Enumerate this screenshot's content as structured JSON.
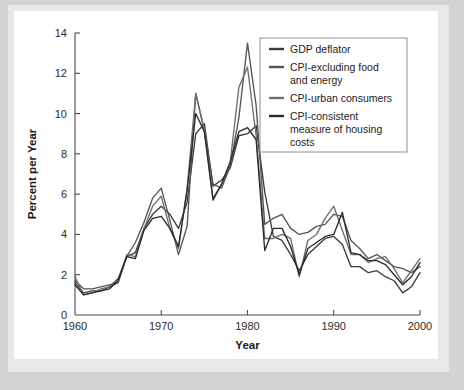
{
  "figure": {
    "background_color": "#d3d3d3",
    "panel_color": "#ffffff",
    "border_color": "#e8e8e8"
  },
  "legend": {
    "position": "top-right",
    "border_color": "#8f8f8f",
    "entries": [
      {
        "label": "GDP deflator",
        "color": "#3c3c3c"
      },
      {
        "label": "CPI-excluding food and energy",
        "line1": "CPI-excluding food",
        "line2": "and energy",
        "color": "#555555"
      },
      {
        "label": "CPI-urban consumers",
        "color": "#6e6e6e"
      },
      {
        "label": "CPI-consistent measure of housing costs",
        "line1": "CPI-consistent",
        "line2": "measure of housing",
        "line3": "costs",
        "color": "#2a2a2a"
      }
    ]
  },
  "axes": {
    "x_title": "Year",
    "y_title": "Percent per Year",
    "x_ticks": [
      "1960",
      "1970",
      "1980",
      "1990",
      "2000"
    ],
    "y_ticks": [
      "0",
      "2",
      "4",
      "6",
      "8",
      "10",
      "12",
      "14"
    ]
  },
  "chart_data": {
    "type": "line",
    "title": "",
    "xlabel": "Year",
    "ylabel": "Percent per Year",
    "xlim": [
      1960,
      2000
    ],
    "ylim": [
      0,
      14
    ],
    "xticks": [
      1960,
      1970,
      1980,
      1990,
      2000
    ],
    "yticks": [
      0,
      2,
      4,
      6,
      8,
      10,
      12,
      14
    ],
    "grid": false,
    "legend_position": "top-right",
    "x": [
      1960,
      1961,
      1962,
      1963,
      1964,
      1965,
      1966,
      1967,
      1968,
      1969,
      1970,
      1971,
      1972,
      1973,
      1974,
      1975,
      1976,
      1977,
      1978,
      1979,
      1980,
      1981,
      1982,
      1983,
      1984,
      1985,
      1986,
      1987,
      1988,
      1989,
      1990,
      1991,
      1992,
      1993,
      1994,
      1995,
      1996,
      1997,
      1998,
      1999,
      2000
    ],
    "series": [
      {
        "name": "GDP deflator",
        "color": "#3c3c3c",
        "values": [
          1.6,
          1.1,
          1.2,
          1.2,
          1.4,
          1.8,
          2.9,
          3.1,
          4.3,
          5.0,
          5.4,
          5.0,
          4.3,
          5.6,
          9.0,
          9.5,
          6.4,
          6.7,
          7.3,
          8.9,
          9.0,
          9.4,
          6.1,
          3.9,
          3.7,
          3.0,
          2.2,
          3.0,
          3.4,
          3.8,
          3.9,
          3.5,
          2.4,
          2.4,
          2.1,
          2.2,
          1.9,
          1.7,
          1.1,
          1.4,
          2.1
        ]
      },
      {
        "name": "CPI-excluding food and energy",
        "color": "#555555",
        "values": [
          1.7,
          1.3,
          1.3,
          1.4,
          1.5,
          1.6,
          2.9,
          3.6,
          4.6,
          5.8,
          6.3,
          4.7,
          3.0,
          4.4,
          11.0,
          9.1,
          6.5,
          6.3,
          7.4,
          9.8,
          13.5,
          10.4,
          4.5,
          4.8,
          5.0,
          4.3,
          4.0,
          4.1,
          4.4,
          4.5,
          5.0,
          4.9,
          3.7,
          3.3,
          2.8,
          3.0,
          2.7,
          2.4,
          2.3,
          2.1,
          2.4
        ]
      },
      {
        "name": "CPI-urban consumers",
        "color": "#6e6e6e",
        "values": [
          1.9,
          1.0,
          1.1,
          1.3,
          1.4,
          1.6,
          3.0,
          2.9,
          4.3,
          5.4,
          5.9,
          4.3,
          3.3,
          6.3,
          11.0,
          9.2,
          5.8,
          6.5,
          7.6,
          11.3,
          12.3,
          8.9,
          3.8,
          3.8,
          4.0,
          3.8,
          1.9,
          3.7,
          4.0,
          4.8,
          5.4,
          4.2,
          3.0,
          3.0,
          2.6,
          2.8,
          2.9,
          2.3,
          1.6,
          2.2,
          2.8
        ]
      },
      {
        "name": "CPI-consistent measure of housing costs",
        "color": "#2a2a2a",
        "values": [
          1.5,
          1.0,
          1.1,
          1.2,
          1.3,
          1.7,
          2.9,
          2.8,
          4.2,
          4.8,
          4.9,
          4.3,
          3.4,
          6.2,
          10.0,
          9.1,
          5.7,
          6.5,
          7.6,
          9.1,
          9.3,
          8.7,
          3.2,
          4.3,
          4.3,
          3.4,
          2.0,
          3.3,
          3.6,
          3.9,
          4.0,
          5.1,
          3.1,
          3.0,
          2.7,
          2.7,
          2.5,
          2.0,
          1.5,
          1.9,
          2.6
        ]
      }
    ]
  }
}
